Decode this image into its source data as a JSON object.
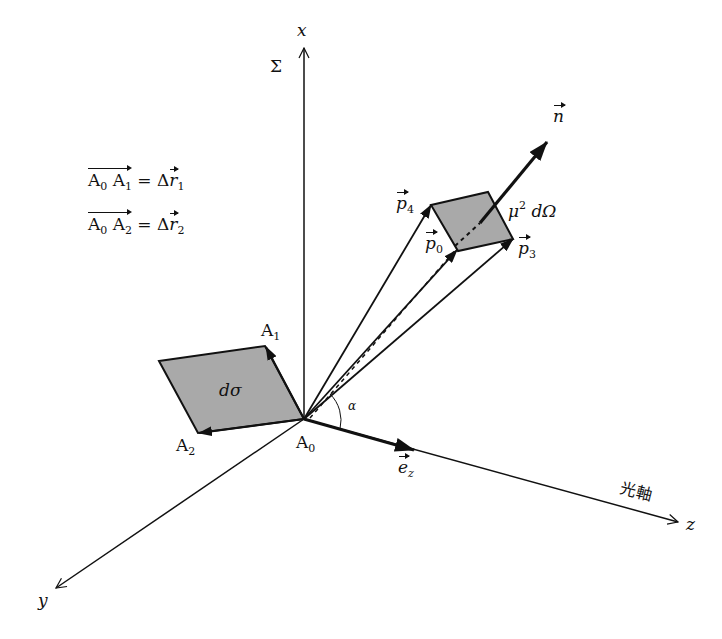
{
  "diagram": {
    "axes": {
      "x_label": "x",
      "y_label": "y",
      "z_label": "z",
      "optical_axis_label": "光軸",
      "plane_label": "Σ"
    },
    "origin_label": "A",
    "origin_sub": "0",
    "points": {
      "a1": {
        "label": "A",
        "sub": "1"
      },
      "a2": {
        "label": "A",
        "sub": "2"
      }
    },
    "surface_element_label": "dσ",
    "angle_label": "α",
    "unit_vector": {
      "label": "e",
      "sub": "z"
    },
    "normal_vector_label": "n",
    "solid_angle": {
      "mu": "μ",
      "exp": "2",
      "rest": "dΩ"
    },
    "momenta": [
      {
        "label": "p",
        "sub": "4"
      },
      {
        "label": "p",
        "sub": "0"
      },
      {
        "label": "p",
        "sub": "3"
      }
    ],
    "equations": [
      {
        "lhs_a": "A",
        "lhs_a_sub": "0",
        "lhs_b": "A",
        "lhs_b_sub": "1",
        "eq": " = Δ",
        "r": "r",
        "r_sub": "1"
      },
      {
        "lhs_a": "A",
        "lhs_a_sub": "0",
        "lhs_b": "A",
        "lhs_b_sub": "2",
        "eq": " = Δ",
        "r": "r",
        "r_sub": "2"
      }
    ],
    "colors": {
      "ink": "#111111",
      "fill": "#a9a9a9",
      "background": "#ffffff"
    }
  }
}
